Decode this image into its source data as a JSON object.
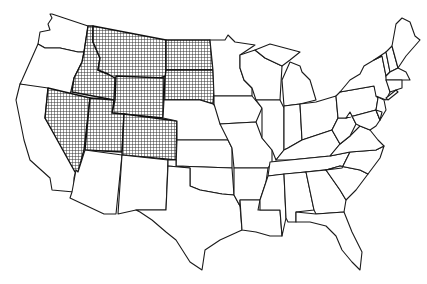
{
  "map": {
    "title": "Map of the contiguous United States",
    "highlight_pattern": "crosshatch",
    "highlight_color": "#333333",
    "outline_color": "#1a1a1a",
    "background": "#ffffff",
    "highlighted_states": [
      "Montana",
      "Idaho",
      "Wyoming",
      "North Dakota",
      "South Dakota",
      "Nevada",
      "Utah",
      "Colorado"
    ],
    "unhighlighted_states_visible": true
  },
  "caption": {
    "text": ""
  }
}
